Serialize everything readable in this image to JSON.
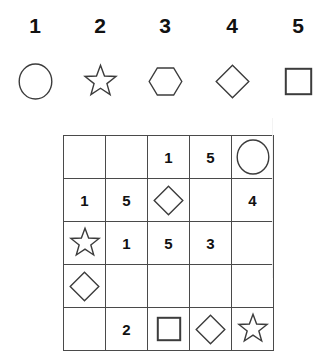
{
  "puzzle": {
    "type": "shape-number-legend-grid",
    "legend": {
      "items": [
        {
          "number": "1",
          "shape": "circle-icon",
          "shape_label": "circle"
        },
        {
          "number": "2",
          "shape": "star-icon",
          "shape_label": "star"
        },
        {
          "number": "3",
          "shape": "hexagon-icon",
          "shape_label": "hexagon"
        },
        {
          "number": "4",
          "shape": "diamond-icon",
          "shape_label": "diamond"
        },
        {
          "number": "5",
          "shape": "square-icon",
          "shape_label": "square"
        }
      ]
    },
    "grid": {
      "rows": 5,
      "columns": 5,
      "cells": [
        [
          {
            "kind": "empty",
            "value": ""
          },
          {
            "kind": "empty",
            "value": ""
          },
          {
            "kind": "number",
            "value": "1"
          },
          {
            "kind": "number",
            "value": "5"
          },
          {
            "kind": "shape",
            "value": "circle-icon"
          }
        ],
        [
          {
            "kind": "number",
            "value": "1"
          },
          {
            "kind": "number",
            "value": "5"
          },
          {
            "kind": "shape",
            "value": "diamond-icon"
          },
          {
            "kind": "empty",
            "value": ""
          },
          {
            "kind": "number",
            "value": "4"
          }
        ],
        [
          {
            "kind": "shape",
            "value": "star-icon"
          },
          {
            "kind": "number",
            "value": "1"
          },
          {
            "kind": "number",
            "value": "5"
          },
          {
            "kind": "number",
            "value": "3"
          },
          {
            "kind": "empty",
            "value": ""
          }
        ],
        [
          {
            "kind": "shape",
            "value": "diamond-icon"
          },
          {
            "kind": "empty",
            "value": ""
          },
          {
            "kind": "empty",
            "value": ""
          },
          {
            "kind": "empty",
            "value": ""
          },
          {
            "kind": "empty",
            "value": ""
          }
        ],
        [
          {
            "kind": "empty",
            "value": ""
          },
          {
            "kind": "number",
            "value": "2"
          },
          {
            "kind": "shape",
            "value": "square-icon"
          },
          {
            "kind": "shape",
            "value": "diamond-icon"
          },
          {
            "kind": "shape",
            "value": "star-icon"
          }
        ]
      ]
    },
    "colors": {
      "background": "#ffffff",
      "text": "#111111",
      "shape_stroke": "#3c3c3c",
      "grid_line": "#4a4a4a"
    }
  }
}
